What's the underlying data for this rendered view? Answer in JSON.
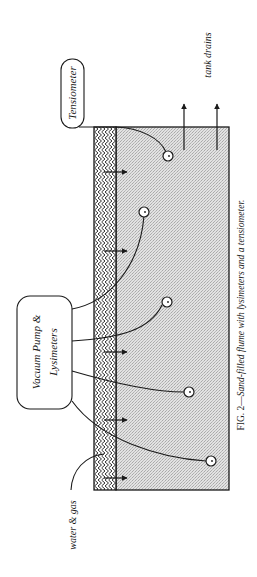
{
  "figure": {
    "caption_prefix": "FIG. 2—",
    "caption_text": "Sand-filled flume with lysimeters and a tensiometer."
  },
  "labels": {
    "tensiometer": "Tensiometer",
    "vacuum_line1": "Vacuum Pump &",
    "vacuum_line2": "Lysimeters",
    "tank_drains": "tank drains",
    "water_gas": "water & gas"
  },
  "colors": {
    "stroke": "#1a1a1a",
    "sand_fill": "#dcdcdc",
    "background": "#ffffff"
  },
  "components": {
    "flume": "sand-filled flume",
    "layer": "gravel / water inlet layer",
    "lysimeter_count": "4",
    "tensiometer_count": "1",
    "inflow_arrows": "5",
    "drain_arrows": "2"
  }
}
